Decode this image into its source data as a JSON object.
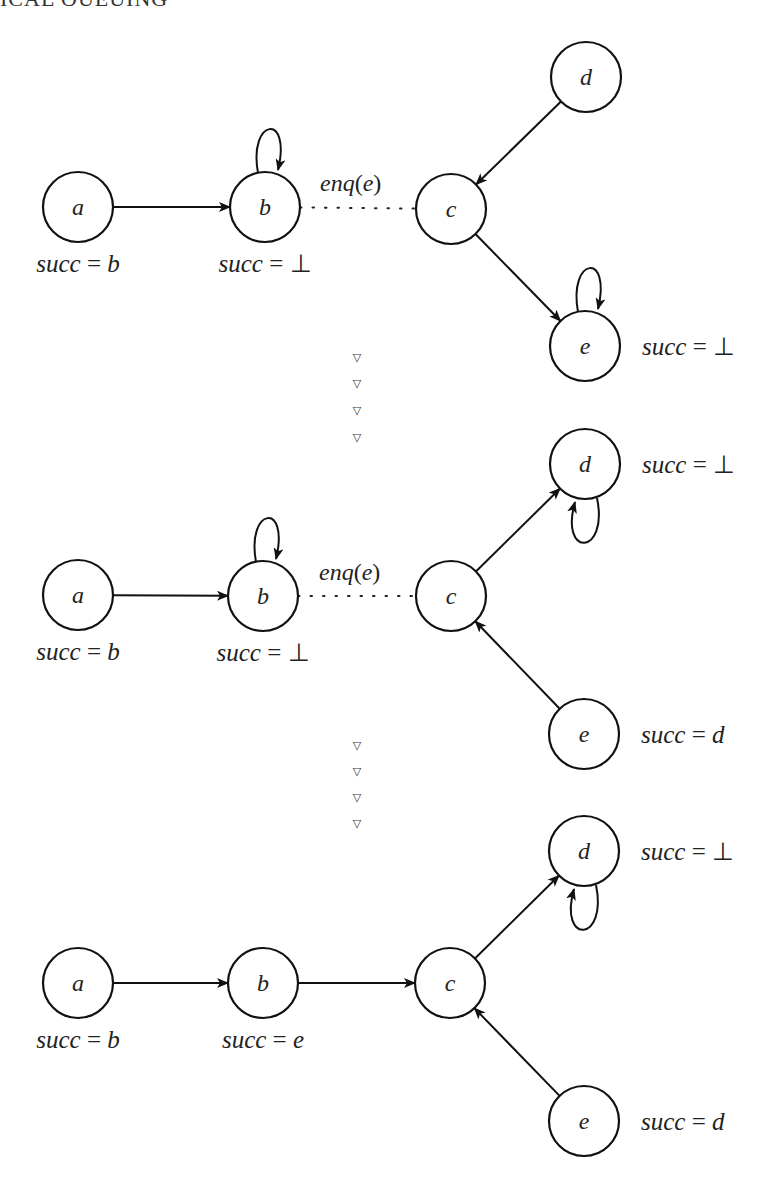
{
  "header": {
    "fragment": "ICAL QUEUING"
  },
  "figure": {
    "node_radius": 35,
    "stages": [
      {
        "id": "stage-1",
        "nodes": [
          {
            "id": "a",
            "label": "a",
            "cx": 78,
            "cy": 207,
            "succ": "succ = b",
            "succ_pos": "below"
          },
          {
            "id": "b",
            "label": "b",
            "cx": 265,
            "cy": 207,
            "succ": "succ = ⊥",
            "succ_pos": "below"
          },
          {
            "id": "c",
            "label": "c",
            "cx": 451,
            "cy": 209,
            "succ": "",
            "succ_pos": "none"
          },
          {
            "id": "d",
            "label": "d",
            "cx": 586,
            "cy": 77,
            "succ": "",
            "succ_pos": "none"
          },
          {
            "id": "e",
            "label": "e",
            "cx": 585,
            "cy": 346,
            "succ": "succ = ⊥",
            "succ_pos": "right"
          }
        ],
        "edges": [
          {
            "from": "a",
            "to": "b",
            "style": "solid"
          },
          {
            "from": "b",
            "to": "c",
            "style": "dotted",
            "label": "enq(e)"
          },
          {
            "from": "d",
            "to": "c",
            "style": "solid"
          },
          {
            "from": "c",
            "to": "e",
            "style": "solid"
          }
        ],
        "self_loops": [
          {
            "node": "b",
            "position": "top"
          },
          {
            "node": "e",
            "position": "top"
          }
        ]
      },
      {
        "id": "stage-2",
        "nodes": [
          {
            "id": "a",
            "label": "a",
            "cx": 78,
            "cy": 595,
            "succ": "succ = b",
            "succ_pos": "below"
          },
          {
            "id": "b",
            "label": "b",
            "cx": 263,
            "cy": 596,
            "succ": "succ = ⊥",
            "succ_pos": "below"
          },
          {
            "id": "c",
            "label": "c",
            "cx": 451,
            "cy": 596,
            "succ": "",
            "succ_pos": "none"
          },
          {
            "id": "d",
            "label": "d",
            "cx": 585,
            "cy": 464,
            "succ": "succ = ⊥",
            "succ_pos": "right"
          },
          {
            "id": "e",
            "label": "e",
            "cx": 584,
            "cy": 734,
            "succ": "succ = d",
            "succ_pos": "right"
          }
        ],
        "edges": [
          {
            "from": "a",
            "to": "b",
            "style": "solid"
          },
          {
            "from": "b",
            "to": "c",
            "style": "dotted",
            "label": "enq(e)"
          },
          {
            "from": "c",
            "to": "d",
            "style": "solid"
          },
          {
            "from": "e",
            "to": "c",
            "style": "solid"
          }
        ],
        "self_loops": [
          {
            "node": "b",
            "position": "top"
          },
          {
            "node": "d",
            "position": "bottom"
          }
        ]
      },
      {
        "id": "stage-3",
        "nodes": [
          {
            "id": "a",
            "label": "a",
            "cx": 78,
            "cy": 983,
            "succ": "succ = b",
            "succ_pos": "below"
          },
          {
            "id": "b",
            "label": "b",
            "cx": 263,
            "cy": 983,
            "succ": "succ = e",
            "succ_pos": "below"
          },
          {
            "id": "c",
            "label": "c",
            "cx": 450,
            "cy": 983,
            "succ": "",
            "succ_pos": "none"
          },
          {
            "id": "d",
            "label": "d",
            "cx": 584,
            "cy": 851,
            "succ": "succ = ⊥",
            "succ_pos": "right"
          },
          {
            "id": "e",
            "label": "e",
            "cx": 584,
            "cy": 1121,
            "succ": "succ = d",
            "succ_pos": "right"
          }
        ],
        "edges": [
          {
            "from": "a",
            "to": "b",
            "style": "solid"
          },
          {
            "from": "b",
            "to": "c",
            "style": "solid"
          },
          {
            "from": "c",
            "to": "d",
            "style": "solid"
          },
          {
            "from": "e",
            "to": "c",
            "style": "solid"
          }
        ],
        "self_loops": [
          {
            "node": "d",
            "position": "bottom"
          }
        ]
      }
    ],
    "transitions": [
      {
        "x": 357,
        "ys": [
          357,
          383,
          410,
          437
        ],
        "glyph": "▽"
      },
      {
        "x": 357,
        "ys": [
          745,
          771,
          797,
          823
        ],
        "glyph": "▽"
      }
    ]
  }
}
